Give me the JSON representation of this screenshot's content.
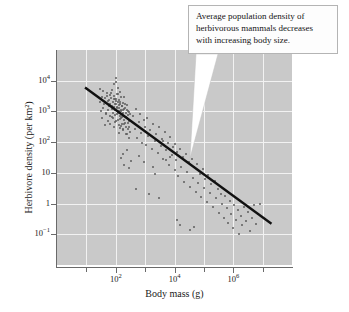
{
  "chart_data": {
    "type": "scatter",
    "title": "",
    "xlabel": "Body mass (g)",
    "ylabel": "Herbivore density (per km²)",
    "xscale": "log",
    "yscale": "log",
    "xlim": [
      1,
      100000000
    ],
    "ylim": [
      0.01,
      100000
    ],
    "grid": true,
    "legend": "none",
    "x_ticks": [
      {
        "value": 100,
        "label": "10",
        "exp": "2",
        "major": true
      },
      {
        "value": 10000,
        "label": "10",
        "exp": "4",
        "major": true
      },
      {
        "value": 1000000,
        "label": "10",
        "exp": "6",
        "major": true
      }
    ],
    "x_minor_ticks": [
      10,
      1000,
      100000,
      10000000
    ],
    "y_ticks": [
      {
        "value": 10000,
        "label": "10",
        "exp": "4"
      },
      {
        "value": 1000,
        "label": "10",
        "exp": "3"
      },
      {
        "value": 100,
        "label": "10",
        "exp": "2"
      },
      {
        "value": 10,
        "label": "10",
        "exp": ""
      },
      {
        "value": 1,
        "label": "1",
        "exp": ""
      },
      {
        "value": 0.1,
        "label": "10",
        "exp": "−1"
      }
    ],
    "trend_line": {
      "type": "regression",
      "slope_decades": -0.75,
      "x_start": 9,
      "y_start": 6000,
      "x_end": 20000000,
      "y_end": 0.22,
      "color": "#111111"
    },
    "point_color": "#5d5d5d",
    "plot_background": "#c9c9c9",
    "gridline_color": "#f2f2f2",
    "n_points": 200,
    "points": [
      [
        35,
        3000
      ],
      [
        40,
        1800
      ],
      [
        45,
        900
      ],
      [
        50,
        4000
      ],
      [
        55,
        2200
      ],
      [
        60,
        1500
      ],
      [
        62,
        700
      ],
      [
        65,
        3500
      ],
      [
        70,
        2800
      ],
      [
        72,
        1200
      ],
      [
        75,
        5000
      ],
      [
        78,
        900
      ],
      [
        80,
        2000
      ],
      [
        82,
        600
      ],
      [
        85,
        3200
      ],
      [
        88,
        1400
      ],
      [
        90,
        8000
      ],
      [
        92,
        2500
      ],
      [
        95,
        1100
      ],
      [
        98,
        450
      ],
      [
        100,
        12000
      ],
      [
        100,
        9000
      ],
      [
        102,
        2600
      ],
      [
        105,
        1700
      ],
      [
        108,
        800
      ],
      [
        110,
        3800
      ],
      [
        112,
        1300
      ],
      [
        115,
        520
      ],
      [
        118,
        2100
      ],
      [
        120,
        6000
      ],
      [
        122,
        950
      ],
      [
        125,
        1600
      ],
      [
        128,
        350
      ],
      [
        130,
        2400
      ],
      [
        132,
        1050
      ],
      [
        135,
        700
      ],
      [
        138,
        4200
      ],
      [
        140,
        1800
      ],
      [
        145,
        280
      ],
      [
        150,
        1150
      ],
      [
        152,
        2900
      ],
      [
        155,
        620
      ],
      [
        158,
        1450
      ],
      [
        160,
        380
      ],
      [
        165,
        850
      ],
      [
        170,
        1900
      ],
      [
        175,
        260
      ],
      [
        180,
        1100
      ],
      [
        185,
        520
      ],
      [
        190,
        3000
      ],
      [
        195,
        700
      ],
      [
        200,
        1300
      ],
      [
        210,
        420
      ],
      [
        220,
        900
      ],
      [
        230,
        180
      ],
      [
        240,
        1600
      ],
      [
        250,
        600
      ],
      [
        260,
        260
      ],
      [
        270,
        1000
      ],
      [
        280,
        140
      ],
      [
        290,
        480
      ],
      [
        300,
        800
      ],
      [
        28,
        2000
      ],
      [
        30,
        5500
      ],
      [
        32,
        1000
      ],
      [
        34,
        600
      ],
      [
        36,
        4500
      ],
      [
        38,
        1300
      ],
      [
        42,
        2700
      ],
      [
        44,
        350
      ],
      [
        46,
        1900
      ],
      [
        48,
        800
      ],
      [
        52,
        3300
      ],
      [
        54,
        1100
      ],
      [
        56,
        500
      ],
      [
        58,
        2300
      ],
      [
        64,
        1700
      ],
      [
        66,
        400
      ],
      [
        68,
        3900
      ],
      [
        74,
        650
      ],
      [
        76,
        1500
      ],
      [
        84,
        2600
      ],
      [
        86,
        300
      ],
      [
        94,
        1800
      ],
      [
        96,
        750
      ],
      [
        104,
        2200
      ],
      [
        106,
        480
      ],
      [
        114,
        1400
      ],
      [
        116,
        3600
      ],
      [
        124,
        900
      ],
      [
        126,
        200
      ],
      [
        134,
        1250
      ],
      [
        136,
        550
      ],
      [
        142,
        2000
      ],
      [
        148,
        330
      ],
      [
        156,
        1050
      ],
      [
        162,
        680
      ],
      [
        168,
        1500
      ],
      [
        172,
        240
      ],
      [
        178,
        880
      ],
      [
        188,
        1200
      ],
      [
        198,
        400
      ],
      [
        205,
        1700
      ],
      [
        215,
        300
      ],
      [
        225,
        650
      ],
      [
        235,
        1100
      ],
      [
        245,
        190
      ],
      [
        255,
        420
      ],
      [
        265,
        750
      ],
      [
        275,
        300
      ],
      [
        285,
        950
      ],
      [
        295,
        220
      ],
      [
        400,
        700
      ],
      [
        450,
        260
      ],
      [
        500,
        1200
      ],
      [
        550,
        140
      ],
      [
        600,
        450
      ],
      [
        650,
        800
      ],
      [
        700,
        200
      ],
      [
        800,
        95
      ],
      [
        900,
        520
      ],
      [
        1000,
        300
      ],
      [
        1100,
        80
      ],
      [
        1200,
        600
      ],
      [
        1300,
        160
      ],
      [
        1500,
        250
      ],
      [
        1700,
        60
      ],
      [
        1900,
        380
      ],
      [
        2100,
        110
      ],
      [
        2400,
        190
      ],
      [
        2700,
        45
      ],
      [
        3000,
        300
      ],
      [
        3400,
        75
      ],
      [
        3800,
        130
      ],
      [
        4200,
        28
      ],
      [
        4700,
        210
      ],
      [
        5200,
        55
      ],
      [
        5800,
        95
      ],
      [
        6500,
        18
      ],
      [
        7200,
        150
      ],
      [
        8000,
        38
      ],
      [
        9000,
        70
      ],
      [
        10000,
        12
      ],
      [
        10000,
        90
      ],
      [
        11000,
        26
      ],
      [
        12000,
        48
      ],
      [
        13000,
        8
      ],
      [
        15000,
        60
      ],
      [
        17000,
        16
      ],
      [
        19000,
        32
      ],
      [
        21000,
        5
      ],
      [
        24000,
        42
      ],
      [
        27000,
        11
      ],
      [
        30000,
        22
      ],
      [
        34000,
        3.5
      ],
      [
        38000,
        28
      ],
      [
        42000,
        7
      ],
      [
        47000,
        15
      ],
      [
        52000,
        2.4
      ],
      [
        58000,
        19
      ],
      [
        65000,
        4.8
      ],
      [
        72000,
        9.5
      ],
      [
        80000,
        1.6
      ],
      [
        90000,
        13
      ],
      [
        100000,
        3.2
      ],
      [
        110000,
        6.5
      ],
      [
        125000,
        1.1
      ],
      [
        140000,
        8.5
      ],
      [
        160000,
        2.2
      ],
      [
        180000,
        4.5
      ],
      [
        200000,
        0.75
      ],
      [
        230000,
        5.5
      ],
      [
        260000,
        1.5
      ],
      [
        300000,
        3.0
      ],
      [
        340000,
        0.5
      ],
      [
        380000,
        2.0
      ],
      [
        430000,
        1.0
      ],
      [
        480000,
        0.35
      ],
      [
        540000,
        1.8
      ],
      [
        600000,
        0.7
      ],
      [
        680000,
        0.24
      ],
      [
        760000,
        1.2
      ],
      [
        850000,
        0.45
      ],
      [
        950000,
        0.16
      ],
      [
        1100000,
        0.9
      ],
      [
        1200000,
        0.3
      ],
      [
        1400000,
        0.6
      ],
      [
        1600000,
        0.1
      ],
      [
        1800000,
        0.4
      ],
      [
        2000000,
        0.2
      ],
      [
        2400000,
        0.8
      ],
      [
        2800000,
        0.28
      ],
      [
        3200000,
        0.55
      ],
      [
        3800000,
        0.13
      ],
      [
        4500000,
        0.35
      ],
      [
        5200000,
        0.9
      ],
      [
        6000000,
        0.22
      ],
      [
        7000000,
        0.45
      ],
      [
        8000000,
        0.95
      ],
      [
        500,
        3.0
      ],
      [
        1400,
        2.0
      ],
      [
        3000,
        1.5
      ],
      [
        150,
        30
      ],
      [
        170,
        42
      ],
      [
        190,
        18
      ],
      [
        250,
        55
      ],
      [
        320,
        25
      ],
      [
        280,
        14
      ],
      [
        600,
        35
      ],
      [
        900,
        22
      ],
      [
        1800,
        16
      ],
      [
        2200,
        9
      ],
      [
        4000,
        110
      ],
      [
        5000,
        26
      ],
      [
        7000,
        33
      ],
      [
        12000,
        0.3
      ],
      [
        16000,
        0.2
      ],
      [
        35000,
        0.14
      ],
      [
        45000,
        0.17
      ]
    ]
  },
  "callout": {
    "lines": [
      "Average population density of",
      "herbivorous mammals decreases",
      "with increasing body size."
    ],
    "border_color": "#b4b4b4",
    "background": "#fdfdfd",
    "leader_color": "#ffffff",
    "leader_target_x": 190,
    "leader_target_y": 158
  }
}
